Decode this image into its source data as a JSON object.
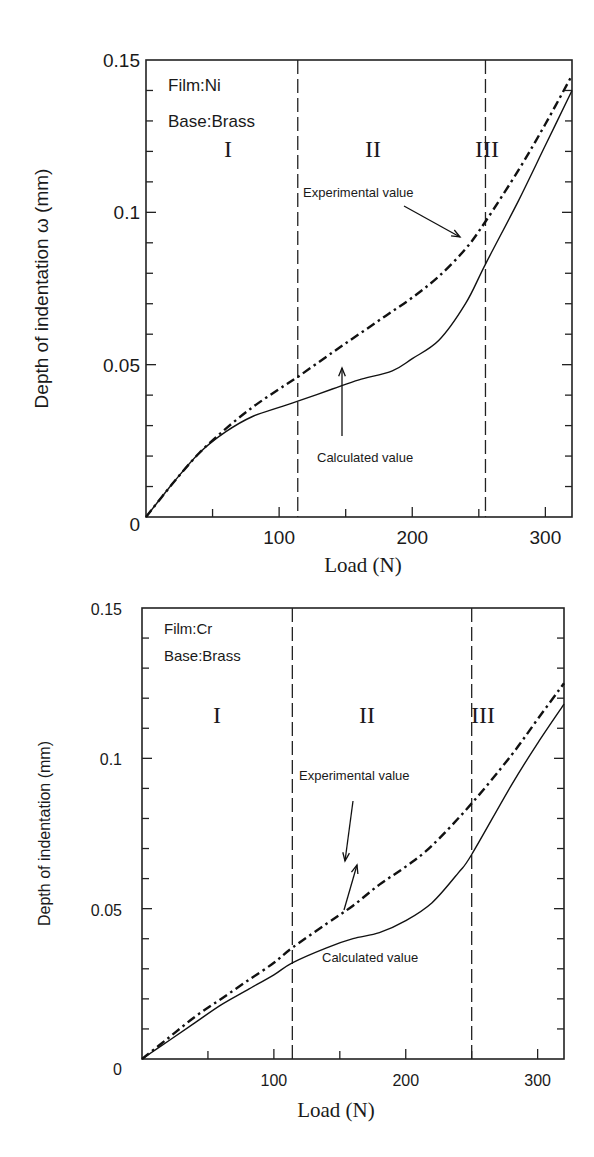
{
  "chart_data": [
    {
      "type": "line",
      "title": "",
      "annotations": {
        "film": "Film:Ni",
        "base": "Base:Brass",
        "regions": [
          "I",
          "II",
          "III"
        ],
        "experimental_label": "Experimental value",
        "calculated_label": "Calculated value"
      },
      "xlabel": "Load (N)",
      "ylabel": "Depth of indentation ω (mm)",
      "xlim": [
        0,
        320
      ],
      "ylim": [
        0,
        0.15
      ],
      "xticks": [
        0,
        100,
        200,
        300
      ],
      "yticks": [
        0,
        0.05,
        0.1,
        0.15
      ],
      "ytick_labels": [
        "0",
        "0.05",
        "0.1",
        "0.15"
      ],
      "xtick_labels": [
        "0",
        "100",
        "200",
        "300"
      ],
      "region_boundaries": [
        114,
        255
      ],
      "grid": false,
      "series": [
        {
          "name": "Experimental value",
          "style": "dash-dot",
          "x": [
            0,
            20,
            40,
            60,
            80,
            100,
            114,
            140,
            160,
            180,
            200,
            220,
            240,
            255,
            280,
            300,
            320
          ],
          "y": [
            0,
            0.011,
            0.021,
            0.029,
            0.036,
            0.042,
            0.046,
            0.054,
            0.06,
            0.066,
            0.072,
            0.079,
            0.088,
            0.097,
            0.114,
            0.129,
            0.145
          ]
        },
        {
          "name": "Calculated value",
          "style": "solid",
          "x": [
            0,
            20,
            40,
            60,
            80,
            100,
            114,
            140,
            160,
            185,
            200,
            220,
            240,
            255,
            280,
            300,
            320
          ],
          "y": [
            0,
            0.011,
            0.021,
            0.028,
            0.033,
            0.036,
            0.038,
            0.042,
            0.045,
            0.048,
            0.052,
            0.058,
            0.07,
            0.083,
            0.104,
            0.122,
            0.14
          ]
        }
      ]
    },
    {
      "type": "line",
      "title": "",
      "annotations": {
        "film": "Film:Cr",
        "base": "Base:Brass",
        "regions": [
          "I",
          "II",
          "III"
        ],
        "experimental_label": "Experimental value",
        "calculated_label": "Calculated value"
      },
      "xlabel": "Load (N)",
      "ylabel": "Depth of indentation (mm)",
      "xlim": [
        0,
        320
      ],
      "ylim": [
        0,
        0.15
      ],
      "xticks": [
        0,
        100,
        200,
        300
      ],
      "yticks": [
        0,
        0.05,
        0.1,
        0.15
      ],
      "ytick_labels": [
        "0",
        "0.05",
        "0.1",
        "0.15"
      ],
      "xtick_labels": [
        "0",
        "100",
        "200",
        "300"
      ],
      "region_boundaries": [
        114,
        250
      ],
      "grid": false,
      "series": [
        {
          "name": "Experimental value",
          "style": "dash-dot",
          "x": [
            0,
            20,
            40,
            60,
            80,
            100,
            114,
            140,
            160,
            180,
            200,
            220,
            250,
            280,
            300,
            320
          ],
          "y": [
            0,
            0.007,
            0.014,
            0.02,
            0.026,
            0.032,
            0.037,
            0.045,
            0.051,
            0.058,
            0.064,
            0.071,
            0.085,
            0.101,
            0.113,
            0.125
          ]
        },
        {
          "name": "Calculated value",
          "style": "solid",
          "x": [
            0,
            20,
            40,
            60,
            80,
            100,
            114,
            140,
            160,
            180,
            200,
            220,
            240,
            250,
            280,
            300,
            320
          ],
          "y": [
            0,
            0.006,
            0.012,
            0.018,
            0.023,
            0.028,
            0.032,
            0.037,
            0.04,
            0.042,
            0.046,
            0.052,
            0.062,
            0.068,
            0.091,
            0.105,
            0.118
          ]
        }
      ]
    }
  ]
}
